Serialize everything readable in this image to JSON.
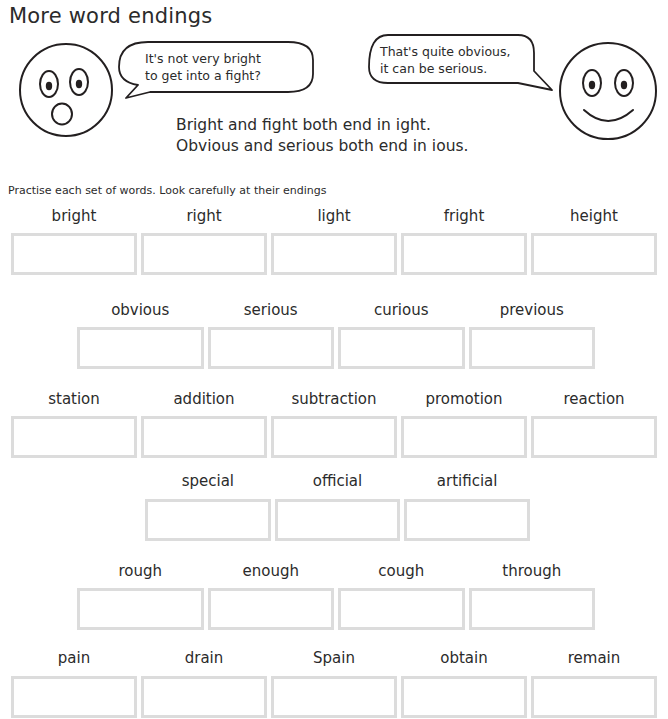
{
  "page": {
    "title": "More word endings",
    "instruction": "Practise each set of words. Look carefully at their endings",
    "rule_line_1": "Bright and fight both end in ight.",
    "rule_line_2": "Obvious and serious both end in ious."
  },
  "characters": {
    "left": {
      "name": "surprised-face",
      "expression": "surprised",
      "speech_line_1": "It's not very bright",
      "speech_line_2": "to get into a fight?"
    },
    "right": {
      "name": "smiling-face",
      "expression": "smiling",
      "speech_line_1": "That's quite obvious,",
      "speech_line_2": "it can be serious."
    }
  },
  "colors": {
    "ink": "#2b2b2b",
    "box_border": "#dcdcdc",
    "page_background": "#ffffff"
  },
  "practice_rows": [
    {
      "id": "row-ight",
      "ending": "ight",
      "words": [
        "bright",
        "right",
        "light",
        "fright",
        "height"
      ]
    },
    {
      "id": "row-ious",
      "ending": "ious",
      "words": [
        "obvious",
        "serious",
        "curious",
        "previous"
      ]
    },
    {
      "id": "row-tion",
      "ending": "tion",
      "words": [
        "station",
        "addition",
        "subtraction",
        "promotion",
        "reaction"
      ]
    },
    {
      "id": "row-cial",
      "ending": "cial",
      "words": [
        "special",
        "official",
        "artificial"
      ]
    },
    {
      "id": "row-ough",
      "ending": "ough",
      "words": [
        "rough",
        "enough",
        "cough",
        "through"
      ]
    },
    {
      "id": "row-ain",
      "ending": "ain",
      "words": [
        "pain",
        "drain",
        "Spain",
        "obtain",
        "remain"
      ]
    }
  ]
}
